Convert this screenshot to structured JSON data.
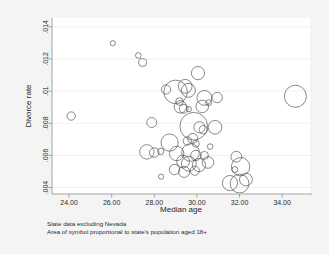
{
  "chart_data": {
    "type": "scatter",
    "title": "",
    "xlabel": "Median age",
    "ylabel": "Divorce rate",
    "xlim": [
      23.2,
      35.4
    ],
    "ylim": [
      0.0036,
      0.01455
    ],
    "grid": true,
    "legend": null,
    "xticks": [
      "24.00",
      "26.00",
      "28.00",
      "30.00",
      "32.00",
      "34.00"
    ],
    "xtick_values": [
      24,
      26,
      28,
      30,
      32,
      34
    ],
    "yticks": [
      ".014",
      ".012",
      ".01",
      ".008",
      ".006",
      ".004"
    ],
    "ytick_values": [
      0.014,
      0.012,
      0.01,
      0.008,
      0.006,
      0.004
    ],
    "size_encoding": "Area of symbol proportional to state's population aged 18+",
    "points": [
      {
        "x": 24.1,
        "y": 0.00845,
        "r": 4.2
      },
      {
        "x": 26.05,
        "y": 0.01298,
        "r": 2.6
      },
      {
        "x": 27.25,
        "y": 0.01222,
        "r": 2.8
      },
      {
        "x": 27.45,
        "y": 0.01178,
        "r": 4.0
      },
      {
        "x": 30.05,
        "y": 0.01112,
        "r": 6.6
      },
      {
        "x": 28.55,
        "y": 0.0101,
        "r": 4.6
      },
      {
        "x": 29.0,
        "y": 0.00995,
        "r": 11.8
      },
      {
        "x": 29.45,
        "y": 0.0103,
        "r": 6.9
      },
      {
        "x": 29.6,
        "y": 0.01005,
        "r": 7.0
      },
      {
        "x": 30.35,
        "y": 0.00958,
        "r": 7.4
      },
      {
        "x": 30.95,
        "y": 0.0096,
        "r": 5.2
      },
      {
        "x": 34.62,
        "y": 0.00968,
        "r": 11.0
      },
      {
        "x": 29.22,
        "y": 0.00902,
        "r": 6.2
      },
      {
        "x": 29.38,
        "y": 0.0089,
        "r": 4.4
      },
      {
        "x": 29.62,
        "y": 0.00888,
        "r": 2.6
      },
      {
        "x": 30.25,
        "y": 0.00905,
        "r": 6.3
      },
      {
        "x": 27.88,
        "y": 0.00805,
        "r": 5.0
      },
      {
        "x": 29.85,
        "y": 0.00782,
        "r": 13.8
      },
      {
        "x": 30.12,
        "y": 0.00775,
        "r": 5.6
      },
      {
        "x": 30.3,
        "y": 0.0076,
        "r": 4.2
      },
      {
        "x": 30.85,
        "y": 0.00775,
        "r": 6.8
      },
      {
        "x": 28.72,
        "y": 0.0068,
        "r": 8.6
      },
      {
        "x": 29.55,
        "y": 0.0069,
        "r": 4.2
      },
      {
        "x": 29.95,
        "y": 0.00672,
        "r": 3.4
      },
      {
        "x": 27.65,
        "y": 0.00622,
        "r": 7.2
      },
      {
        "x": 28.0,
        "y": 0.00618,
        "r": 4.8
      },
      {
        "x": 28.3,
        "y": 0.00625,
        "r": 3.2
      },
      {
        "x": 29.05,
        "y": 0.00612,
        "r": 7.2
      },
      {
        "x": 29.7,
        "y": 0.00618,
        "r": 8.8
      },
      {
        "x": 29.95,
        "y": 0.006,
        "r": 5.2
      },
      {
        "x": 30.35,
        "y": 0.006,
        "r": 4.0
      },
      {
        "x": 29.35,
        "y": 0.00562,
        "r": 6.4
      },
      {
        "x": 29.62,
        "y": 0.00548,
        "r": 7.4
      },
      {
        "x": 30.1,
        "y": 0.0054,
        "r": 6.6
      },
      {
        "x": 30.52,
        "y": 0.00556,
        "r": 5.8
      },
      {
        "x": 28.95,
        "y": 0.00512,
        "r": 5.2
      },
      {
        "x": 29.4,
        "y": 0.00498,
        "r": 5.6
      },
      {
        "x": 29.9,
        "y": 0.00505,
        "r": 4.6
      },
      {
        "x": 28.32,
        "y": 0.00468,
        "r": 2.6
      },
      {
        "x": 31.85,
        "y": 0.00592,
        "r": 5.4
      },
      {
        "x": 32.05,
        "y": 0.0053,
        "r": 9.2
      },
      {
        "x": 31.78,
        "y": 0.00512,
        "r": 3.0
      },
      {
        "x": 31.55,
        "y": 0.00428,
        "r": 7.6
      },
      {
        "x": 32.0,
        "y": 0.00425,
        "r": 9.4
      },
      {
        "x": 32.3,
        "y": 0.0045,
        "r": 6.4
      },
      {
        "x": 29.18,
        "y": 0.00935,
        "r": 3.8
      },
      {
        "x": 30.55,
        "y": 0.00928,
        "r": 3.0
      },
      {
        "x": 29.8,
        "y": 0.00706,
        "r": 5.0
      },
      {
        "x": 30.62,
        "y": 0.00655,
        "r": 2.8
      }
    ]
  },
  "caption": {
    "line1": "State data excluding Nevada",
    "line2": "Area of symbol proportional to state's population aged 18+"
  },
  "colors": {
    "symbol_stroke": "#4a4a52",
    "grid": "#e6e6e6",
    "axis": "#9a9a9a",
    "plot_background": "#ffffff",
    "page_background": "#f4f4f4",
    "text": "#2b2b2b"
  }
}
